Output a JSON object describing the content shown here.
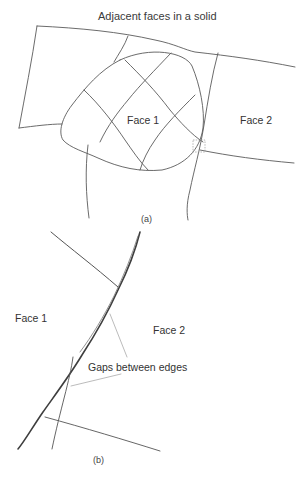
{
  "figure": {
    "title": "Adjacent faces in a solid",
    "panel_a": {
      "caption": "(a)",
      "face1_label": "Face 1",
      "face2_label": "Face 2"
    },
    "panel_b": {
      "caption": "(b)",
      "face1_label": "Face 1",
      "face2_label": "Face 2",
      "annotation": "Gaps between edges"
    }
  },
  "colors": {
    "line": "#555555",
    "thick_edge": "#444444",
    "leader_line": "#aaaaaa",
    "highlight_box": "#999999",
    "text": "#333333"
  }
}
